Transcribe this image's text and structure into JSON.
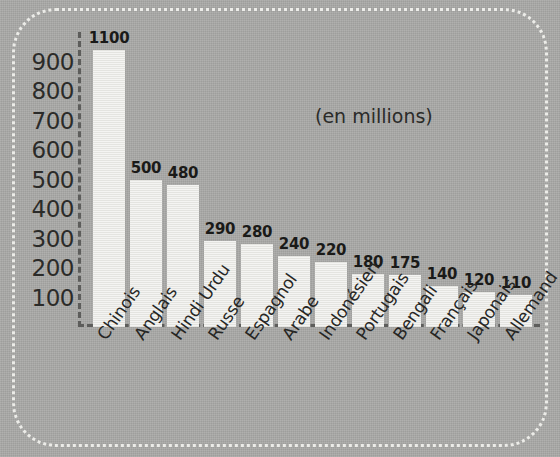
{
  "chart_data": {
    "type": "bar",
    "title": "",
    "subtitle": "",
    "annotation": "(en millions)",
    "xlabel": "",
    "ylabel": "",
    "unit_note": "(en millions)",
    "ylim": [
      0,
      1100
    ],
    "y_ticks": [
      100,
      200,
      300,
      400,
      500,
      600,
      700,
      800,
      900
    ],
    "grid": false,
    "legend": null,
    "axis_style": "dashed",
    "categories": [
      "Chinois",
      "Anglais",
      "Hindi Urdu",
      "Russe",
      "Espagnol",
      "Arabe",
      "Indonésien",
      "Portugais",
      "Bengali",
      "Français",
      "Japonais",
      "Allemand"
    ],
    "values": [
      1100,
      500,
      480,
      290,
      280,
      240,
      220,
      180,
      175,
      140,
      120,
      110
    ],
    "value_labels": [
      "1100",
      "500",
      "480",
      "290",
      "280",
      "240",
      "220",
      "180",
      "175",
      "140",
      "120",
      "110"
    ]
  },
  "colors": {
    "background": "#a9a9a7",
    "bar_fill": "#e9e9e5",
    "axis": "#5d5d5b",
    "text": "#262624",
    "frame": "#f2f2ee"
  },
  "y_tick_labels": [
    "900",
    "800",
    "700",
    "600",
    "500",
    "400",
    "300",
    "200",
    "100"
  ]
}
